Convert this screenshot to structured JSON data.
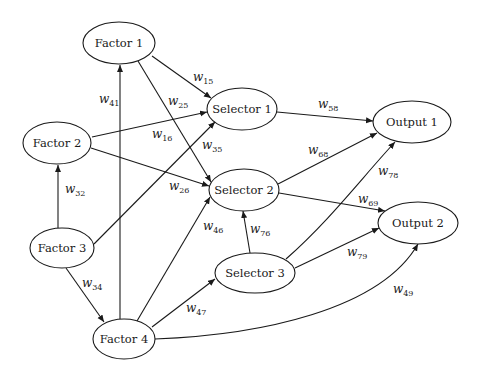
{
  "diagram": {
    "nodes": [
      {
        "id": "f1",
        "label": "Factor 1",
        "cx": 119,
        "cy": 43,
        "rx": 36,
        "ry": 21
      },
      {
        "id": "f2",
        "label": "Factor 2",
        "cx": 57,
        "cy": 143,
        "rx": 34,
        "ry": 21
      },
      {
        "id": "f3",
        "label": "Factor 3",
        "cx": 62,
        "cy": 248,
        "rx": 32,
        "ry": 20
      },
      {
        "id": "f4",
        "label": "Factor 4",
        "cx": 124,
        "cy": 339,
        "rx": 31,
        "ry": 20
      },
      {
        "id": "s1",
        "label": "Selector 1",
        "cx": 242,
        "cy": 109,
        "rx": 35,
        "ry": 21
      },
      {
        "id": "s2",
        "label": "Selector 2",
        "cx": 244,
        "cy": 190,
        "rx": 35,
        "ry": 21
      },
      {
        "id": "s3",
        "label": "Selector 3",
        "cx": 255,
        "cy": 273,
        "rx": 40,
        "ry": 20
      },
      {
        "id": "o1",
        "label": "Output 1",
        "cx": 412,
        "cy": 122,
        "rx": 39,
        "ry": 21
      },
      {
        "id": "o2",
        "label": "Output 2",
        "cx": 418,
        "cy": 223,
        "rx": 40,
        "ry": 21
      }
    ],
    "edges": [
      {
        "id": "w15",
        "from": "f1",
        "to": "s1",
        "w": "w",
        "sub": "15",
        "d": "M152,56 L211,98",
        "lx": 193,
        "ly": 81
      },
      {
        "id": "w25",
        "from": "f1",
        "to": "s2",
        "w": "w",
        "sub": "25",
        "d": "M138,61 L211,182",
        "lx": 168,
        "ly": 105
      },
      {
        "id": "w41",
        "from": "f4",
        "to": "f1",
        "w": "w",
        "sub": "41",
        "d": "M120,319 L120,65",
        "lx": 99,
        "ly": 103
      },
      {
        "id": "w16",
        "from": "f2",
        "to": "s1",
        "w": "w",
        "sub": "16",
        "d": "M92,137 L207,112",
        "lx": 152,
        "ly": 138
      },
      {
        "id": "w35",
        "from": "f3",
        "to": "s1",
        "w": "w",
        "sub": "35",
        "d": "M94,244 L215,122",
        "lx": 202,
        "ly": 149
      },
      {
        "id": "w26",
        "from": "f2",
        "to": "s2",
        "w": "w",
        "sub": "26",
        "d": "M91,148 L209,186",
        "lx": 169,
        "ly": 190
      },
      {
        "id": "w32",
        "from": "f3",
        "to": "f2",
        "w": "w",
        "sub": "32",
        "d": "M58,228 L58,165",
        "lx": 65,
        "ly": 193
      },
      {
        "id": "w58",
        "from": "s1",
        "to": "o1",
        "w": "w",
        "sub": "58",
        "d": "M277,112 L373,121",
        "lx": 318,
        "ly": 108
      },
      {
        "id": "w68",
        "from": "s2",
        "to": "o1",
        "w": "w",
        "sub": "68",
        "d": "M278,184 L377,133",
        "lx": 308,
        "ly": 154
      },
      {
        "id": "w78",
        "from": "s3",
        "to": "o1",
        "w": "w",
        "sub": "78",
        "d": "M286,259 C330,220 360,180 395,142",
        "lx": 378,
        "ly": 175
      },
      {
        "id": "w69",
        "from": "s2",
        "to": "o2",
        "w": "w",
        "sub": "69",
        "d": "M279,193 L385,211",
        "lx": 358,
        "ly": 203
      },
      {
        "id": "w76",
        "from": "s3",
        "to": "s2",
        "w": "w",
        "sub": "76",
        "d": "M250,253 L243,211",
        "lx": 250,
        "ly": 233
      },
      {
        "id": "w79",
        "from": "s3",
        "to": "o2",
        "w": "w",
        "sub": "79",
        "d": "M295,268 L379,228",
        "lx": 347,
        "ly": 256
      },
      {
        "id": "w46",
        "from": "f4",
        "to": "s2",
        "w": "w",
        "sub": "46",
        "d": "M137,321 L210,197",
        "lx": 203,
        "ly": 230
      },
      {
        "id": "w34",
        "from": "f3",
        "to": "f4",
        "w": "w",
        "sub": "34",
        "d": "M66,268 L104,322",
        "lx": 82,
        "ly": 287
      },
      {
        "id": "w47",
        "from": "f4",
        "to": "s3",
        "w": "w",
        "sub": "47",
        "d": "M152,327 L215,279",
        "lx": 186,
        "ly": 312
      },
      {
        "id": "w49",
        "from": "f4",
        "to": "o2",
        "w": "w",
        "sub": "49",
        "d": "M155,339 C260,335 380,310 418,244",
        "lx": 393,
        "ly": 293
      }
    ]
  }
}
